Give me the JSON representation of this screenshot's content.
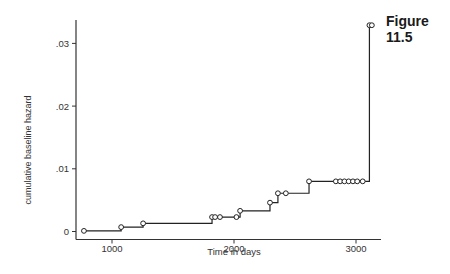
{
  "figure": {
    "title": "Figure 11.5"
  },
  "chart_data": {
    "type": "line",
    "subtype": "step",
    "title": "Figure 11.5",
    "xlabel": "Time in days",
    "ylabel": "cumulative baseline hazard",
    "xlim": [
      700,
      3250
    ],
    "ylim": [
      0,
      0.0335
    ],
    "x_ticks": [
      1000,
      2000,
      3000
    ],
    "x_tick_labels": [
      "1000",
      "2000",
      "3000"
    ],
    "y_ticks": [
      0,
      0.01,
      0.02,
      0.03
    ],
    "y_tick_labels": [
      "0",
      ".01",
      ".02",
      ".03"
    ],
    "grid": false,
    "legend": null,
    "series": [
      {
        "name": "cumulative baseline hazard",
        "markers": "hollow-circle",
        "x": [
          770,
          1075,
          1255,
          1820,
          1845,
          1885,
          2020,
          2050,
          2295,
          2360,
          2425,
          2615,
          2835,
          2870,
          2905,
          2940,
          2975,
          3010,
          3055,
          3110,
          3130
        ],
        "y": [
          0.0001,
          0.0007,
          0.0013,
          0.0023,
          0.0023,
          0.0023,
          0.0023,
          0.0033,
          0.0046,
          0.0061,
          0.0061,
          0.008,
          0.008,
          0.008,
          0.008,
          0.008,
          0.008,
          0.008,
          0.008,
          0.0329,
          0.0329
        ]
      }
    ]
  }
}
